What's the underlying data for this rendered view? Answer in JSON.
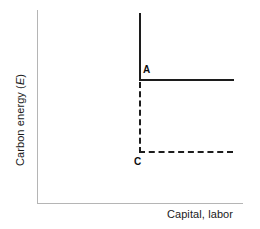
{
  "chart_data": {
    "type": "line",
    "title": "",
    "subtitle": "",
    "xlabel": "Capital, labor",
    "ylabel": "Carbon energy (E)",
    "ylabel_plain": "Carbon energy",
    "ylabel_symbol": "E",
    "grid": false,
    "legend": "none",
    "axis_color": "#b5b5b5",
    "line_color": "#1c1c1c",
    "xlim": [
      0,
      100
    ],
    "ylim": [
      0,
      100
    ],
    "xticks": [],
    "yticks": [],
    "annotations": [
      {
        "text": "A",
        "x": 52,
        "y": 66
      },
      {
        "text": "C",
        "x": 48,
        "y": 26
      }
    ],
    "series": [
      {
        "name": "A",
        "style": "solid",
        "shape": "L-shaped isoquant",
        "corner": {
          "x": 52,
          "y": 64
        },
        "points": [
          {
            "x": 52,
            "y": 100
          },
          {
            "x": 52,
            "y": 64
          },
          {
            "x": 100,
            "y": 64
          }
        ]
      },
      {
        "name": "C",
        "style": "dashed",
        "shape": "L-shaped isoquant",
        "corner": {
          "x": 52,
          "y": 27
        },
        "points": [
          {
            "x": 52,
            "y": 63
          },
          {
            "x": 52,
            "y": 27
          },
          {
            "x": 100,
            "y": 27
          }
        ]
      }
    ]
  },
  "labels": {
    "y_axis_text": "Carbon energy (",
    "y_axis_symbol": "E",
    "y_axis_close": ")",
    "x_axis_text": "Capital, labor",
    "point_a": "A",
    "point_c": "C"
  }
}
